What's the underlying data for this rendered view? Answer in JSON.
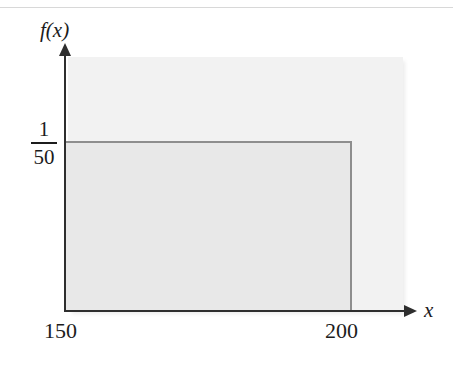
{
  "figure": {
    "type": "probability-density-plot",
    "axis_labels": {
      "y": "f(x)",
      "x": "x"
    },
    "y_tick": {
      "numerator": "1",
      "denominator": "50"
    },
    "x_ticks": {
      "left": "150",
      "right": "200"
    },
    "colors": {
      "axis": "#2e2e2e",
      "rect_border": "#8e8e8e",
      "rect_fill": "#e8e8e8",
      "background_block": "#f2f2f2",
      "page_rule": "#d8d8d8"
    }
  },
  "chart_data": {
    "type": "area",
    "title": "",
    "xlabel": "x",
    "ylabel": "f(x)",
    "x": [
      150,
      200
    ],
    "values": [
      0.02,
      0.02
    ],
    "series": [
      {
        "name": "f(x)",
        "values": [
          0.02,
          0.02
        ]
      }
    ],
    "categories": [
      "150",
      "200"
    ],
    "tick_labels": {
      "x": [
        "150",
        "200"
      ],
      "y": [
        "1/50"
      ]
    },
    "annotations": [
      "Uniform density on the interval from 150 to 200 with constant height 1/50"
    ],
    "xlim": [
      150,
      210
    ],
    "ylim": [
      0,
      0.03
    ],
    "grid": false,
    "legend": "none",
    "shaded_region": {
      "x_start": 150,
      "x_end": 200,
      "height": 0.02
    }
  }
}
